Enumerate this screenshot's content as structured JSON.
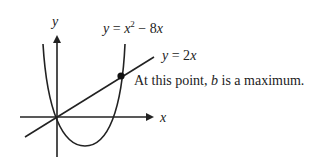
{
  "diagram": {
    "type": "graph",
    "axes": {
      "x_label": "x",
      "y_label": "y"
    },
    "curves": [
      {
        "name": "parabola",
        "equation_lhs": "y",
        "equation_eq": " = ",
        "equation_base": "x",
        "equation_exp": "2",
        "equation_rest": " − 8",
        "equation_var": "x"
      },
      {
        "name": "line",
        "equation_lhs": "y",
        "equation_eq": " = 2",
        "equation_var": "x"
      }
    ],
    "annotation": {
      "prefix": "At this point, ",
      "var": "b",
      "suffix": " is a maximum."
    },
    "colors": {
      "stroke": "#222222",
      "text": "#222222",
      "background": "#ffffff"
    }
  }
}
